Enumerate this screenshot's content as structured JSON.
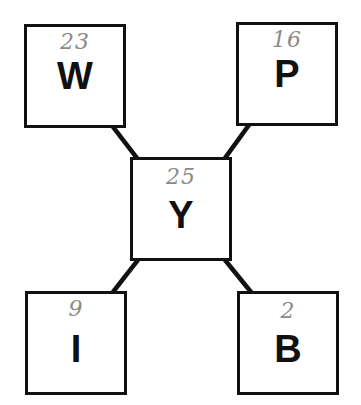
{
  "diagram": {
    "type": "hub-and-spoke",
    "center": {
      "id": "Y",
      "letter": "Y",
      "count": "25"
    },
    "nodes": [
      {
        "id": "W",
        "letter": "W",
        "count": "23",
        "position": "top-left"
      },
      {
        "id": "P",
        "letter": "P",
        "count": "16",
        "position": "top-right"
      },
      {
        "id": "I",
        "letter": "I",
        "count": "9",
        "position": "bottom-left"
      },
      {
        "id": "B",
        "letter": "B",
        "count": "2",
        "position": "bottom-right"
      }
    ],
    "edges": [
      {
        "from": "W",
        "to": "Y"
      },
      {
        "from": "P",
        "to": "Y"
      },
      {
        "from": "I",
        "to": "Y"
      },
      {
        "from": "B",
        "to": "Y"
      }
    ],
    "colors": {
      "stroke": "#111111",
      "letter": "#111111",
      "handwritten_count": "#8a8a8a",
      "background": "#ffffff"
    }
  }
}
